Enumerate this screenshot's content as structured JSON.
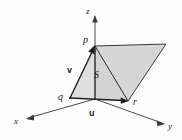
{
  "figure": {
    "background_color": "#fdfdfd",
    "fill_color": "#d8d8d8",
    "fill_color_light": "#e2e2e2",
    "stroke_color": "#2b2b2b",
    "axis_color": "#4a4a4a"
  },
  "axes": [
    {
      "id": "x",
      "label": "x",
      "x": 16,
      "y": 123
    },
    {
      "id": "y",
      "label": "y",
      "x": 170,
      "y": 128
    },
    {
      "id": "z",
      "label": "z",
      "x": 88,
      "y": 12
    }
  ],
  "points": [
    {
      "id": "p",
      "label": "p",
      "x": 85,
      "y": 42
    },
    {
      "id": "q",
      "label": "q",
      "x": 61,
      "y": 99
    },
    {
      "id": "r",
      "label": "r",
      "x": 135,
      "y": 104
    }
  ],
  "vectors": [
    {
      "id": "u",
      "label": "u",
      "x": 92,
      "y": 115,
      "from": "q",
      "to": "r"
    },
    {
      "id": "v",
      "label": "v",
      "x": 70,
      "y": 71,
      "from": "q",
      "to": "p"
    }
  ],
  "regions": [
    {
      "id": "S",
      "label": "S",
      "x": 96,
      "y": 76
    }
  ],
  "geometry": {
    "origin": {
      "x": 95,
      "y": 99
    },
    "p": {
      "x": 95,
      "y": 46
    },
    "q": {
      "x": 70,
      "y": 98
    },
    "r": {
      "x": 128,
      "y": 101
    },
    "far_corner": {
      "x": 166,
      "y": 44
    },
    "z_axis_top": {
      "x": 95,
      "y": 16
    },
    "x_axis_end": {
      "x": 26,
      "y": 119
    },
    "y_axis_end": {
      "x": 164,
      "y": 124
    }
  }
}
